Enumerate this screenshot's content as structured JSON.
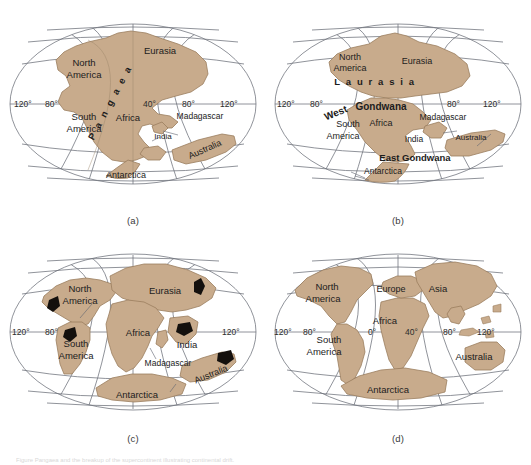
{
  "figure": {
    "caption": "Figure   Pangaea and the breakup of the supercontinent illustrating continental drift.",
    "colors": {
      "land_fill": "#c8ab8c",
      "land_stroke": "#9a7d5e",
      "graticule": "#6b6f78",
      "arrow": "#1a1512",
      "label_text": "#1c1c1c",
      "background": "#ffffff"
    }
  },
  "panels": [
    {
      "id": "a",
      "caption": "(a)",
      "longitudes": [
        "120°",
        "80°",
        "40°",
        "80°",
        "120°"
      ],
      "supercontinent_label": "P a n g a e a",
      "labels": [
        "North\nAmerica",
        "Eurasia",
        "South\nAmerica",
        "Africa",
        "India",
        "Madagascar",
        "Australia",
        "Antarctica"
      ],
      "label_list": {
        "north_america_1": "North",
        "north_america_2": "America",
        "eurasia": "Eurasia",
        "south_america_1": "South",
        "south_america_2": "America",
        "africa": "Africa",
        "india": "India",
        "madagascar": "Madagascar",
        "australia": "Australia",
        "antarctica": "Antarctica"
      },
      "lon_left_1": "120°",
      "lon_left_2": "80°",
      "lon_right_1": "40°",
      "lon_right_2": "80°",
      "lon_right_3": "120°"
    },
    {
      "id": "b",
      "caption": "(b)",
      "supercontinent_labels": [
        "L a u r a s i a",
        "Gondwana",
        "West",
        "East  Gondwana"
      ],
      "label_list": {
        "north_america_1": "North",
        "north_america_2": "America",
        "eurasia": "Eurasia",
        "laurasia": "L a u r a s i a",
        "gondwana": "Gondwana",
        "west": "West",
        "east_gondwana": "East  Gondwana",
        "south_america_1": "South",
        "south_america_2": "America",
        "africa": "Africa",
        "india": "India",
        "madagascar": "Madagascar",
        "australia": "Australia",
        "antarctica": "Antarctica"
      },
      "lon_left_1": "120°",
      "lon_left_2": "80°",
      "lon_right_1": "80°",
      "lon_right_2": "120°"
    },
    {
      "id": "c",
      "caption": "(c)",
      "label_list": {
        "north_america_1": "North",
        "north_america_2": "America",
        "eurasia": "Eurasia",
        "south_america_1": "South",
        "south_america_2": "America",
        "africa": "Africa",
        "india": "India",
        "madagascar": "Madagascar",
        "australia": "Australia",
        "antarctica": "Antarctica"
      },
      "lon_left_1": "120°",
      "lon_left_2": "80°",
      "lon_right_1": "120°",
      "motion_arrows": 5
    },
    {
      "id": "d",
      "caption": "(d)",
      "label_list": {
        "north_america_1": "North",
        "north_america_2": "America",
        "europe": "Europe",
        "asia": "Asia",
        "south_america_1": "South",
        "south_america_2": "America",
        "africa": "Africa",
        "australia": "Australia",
        "antarctica": "Antarctica"
      },
      "lon_left_1": "120°",
      "lon_left_2": "80°",
      "lon_mid": "0°",
      "lon_right_1": "40°",
      "lon_right_2": "80°",
      "lon_right_3": "120°"
    }
  ]
}
